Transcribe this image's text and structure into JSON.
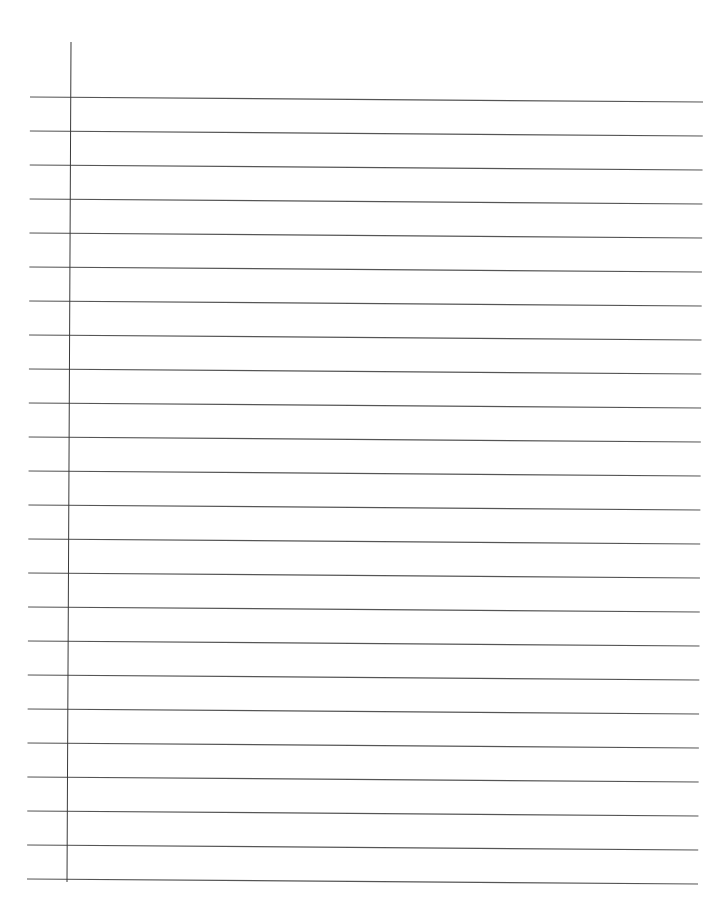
{
  "page": {
    "type": "lined-paper",
    "width": 708,
    "height": 917,
    "background": "#ffffff"
  },
  "margin_line": {
    "x_top": 71,
    "y_top": 42,
    "x_bottom": 67,
    "y_bottom": 882,
    "color": "#3a3a3a",
    "width": 1
  },
  "ruled_lines": {
    "count": 24,
    "first_y_left": 97,
    "first_y_right": 102,
    "spacing": 34,
    "x_left_top": 30,
    "x_left_bottom": 27,
    "x_right_top": 703,
    "x_right_bottom": 698,
    "color": "#555555",
    "width": 1.2
  }
}
